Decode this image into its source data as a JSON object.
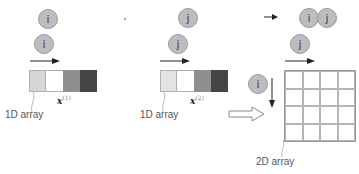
{
  "diagram": {
    "top_row": {
      "left_index": "i",
      "middle_index": "j",
      "right_indices": [
        "i",
        "j"
      ]
    },
    "panel1": {
      "index": "i",
      "label": "1D array",
      "vector_symbol": "x",
      "vector_superscript": "(1)",
      "cell_colors": [
        "#d6d6d6",
        "#ffffff",
        "#8f8f8f",
        "#454545"
      ]
    },
    "panel2": {
      "index": "j",
      "label": "1D array",
      "vector_symbol": "x",
      "vector_superscript": "(2)",
      "cell_colors": [
        "#e3e3e3",
        "#ffffff",
        "#8f8f8f",
        "#454545"
      ]
    },
    "panel3": {
      "row_index": "i",
      "col_index": "j",
      "label": "2D array",
      "grid_rows": 4,
      "grid_cols": 4
    },
    "colors": {
      "circle_fill": "#bdbdbd",
      "circle_border": "#9a9a9a",
      "arrow": "#222222",
      "grid_line": "#b5b5b5"
    }
  }
}
